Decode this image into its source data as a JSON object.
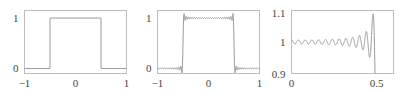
{
  "chart_data": [
    {
      "type": "line",
      "title": "",
      "description": "Square (rectangular) pulse: 1 for |x| < 0.5, 0 otherwise",
      "xlabel": "",
      "ylabel": "",
      "xlim": [
        -1,
        1
      ],
      "ylim": [
        -0.1,
        1.15
      ],
      "xticks": [
        -1,
        0,
        1
      ],
      "xtick_labels": [
        "−1",
        "0",
        "1"
      ],
      "yticks": [
        0,
        1
      ],
      "ytick_labels": [
        "0",
        "1"
      ],
      "grid": false,
      "series": [
        {
          "name": "square-wave",
          "x": [
            -1,
            -0.5,
            -0.5,
            0.5,
            0.5,
            1
          ],
          "y": [
            0,
            0,
            1,
            1,
            0,
            0
          ]
        }
      ]
    },
    {
      "type": "line",
      "title": "",
      "description": "Truncated Fourier series of the square pulse showing Gibbs ringing at the jumps",
      "xlabel": "",
      "ylabel": "",
      "xlim": [
        -1,
        1
      ],
      "ylim": [
        -0.1,
        1.15
      ],
      "xticks": [
        -1,
        0,
        1
      ],
      "xtick_labels": [
        "−1",
        "0",
        "1"
      ],
      "yticks": [
        0,
        1
      ],
      "ytick_labels": [
        "0",
        "1"
      ],
      "grid": false,
      "series": [
        {
          "name": "fourier-partial-sum",
          "formula": "0.5 + sum_{k odd, k<=N} (2/(k*pi)) * sin(k*pi/2) * cos(k*pi*x)",
          "harmonics_N": 49,
          "x_samples_approx": [
            -1,
            -0.75,
            -0.52,
            -0.5,
            -0.48,
            0,
            0.48,
            0.5,
            0.52,
            0.75,
            1
          ],
          "y_samples_approx": [
            0,
            0,
            -0.09,
            0.5,
            1.09,
            1,
            1.09,
            0.5,
            -0.09,
            0,
            0
          ]
        }
      ]
    },
    {
      "type": "line",
      "title": "",
      "description": "Zoom near the jump at x = 0.5 showing growing oscillation (Gibbs overshoot ~1.09)",
      "xlabel": "",
      "ylabel": "",
      "xlim": [
        0,
        0.6
      ],
      "ylim": [
        0.9,
        1.1
      ],
      "xticks": [
        0,
        0.5
      ],
      "xtick_labels": [
        "0",
        "0.5"
      ],
      "yticks": [
        0.9,
        1,
        1.1
      ],
      "ytick_labels": [
        "0.9",
        "1",
        "1.1"
      ],
      "grid": false,
      "series": [
        {
          "name": "fourier-partial-sum-zoom",
          "harmonics_N": 49,
          "x_samples_approx": [
            0,
            0.1,
            0.2,
            0.3,
            0.4,
            0.45,
            0.48,
            0.5
          ],
          "y_samples_approx": [
            1.0,
            1.0,
            1.0,
            1.0,
            0.98,
            0.95,
            1.09,
            0.5
          ]
        }
      ]
    }
  ]
}
